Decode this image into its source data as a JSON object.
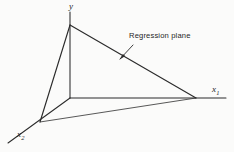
{
  "figure": {
    "background_color": "#fbfbfa",
    "stroke_color": "#2b2b2b",
    "width": 234,
    "height": 152,
    "caption": "Regression plane"
  },
  "axes": [
    {
      "id": "y",
      "label": "y",
      "subscript": "",
      "description": "vertical response axis",
      "from": [
        70,
        98
      ],
      "to": [
        70,
        12
      ]
    },
    {
      "id": "x1",
      "label": "x",
      "subscript": "1",
      "description": "horizontal axis to the right",
      "from": [
        70,
        98
      ],
      "to": [
        226,
        98
      ]
    },
    {
      "id": "x2",
      "label": "x",
      "subscript": "2",
      "description": "depth axis toward lower left",
      "from": [
        70,
        98
      ],
      "to": [
        8,
        143
      ]
    }
  ],
  "plane": {
    "name": "Regression plane",
    "vertices": [
      [
        70,
        25
      ],
      [
        196,
        98
      ],
      [
        40,
        122
      ]
    ]
  },
  "reference_box": {
    "description": "projection lines of the plane onto the axes",
    "segments": [
      [
        [
          70,
          25
        ],
        [
          70,
          98
        ]
      ],
      [
        [
          70,
          98
        ],
        [
          196,
          98
        ]
      ],
      [
        [
          70,
          98
        ],
        [
          40,
          122
        ]
      ],
      [
        [
          40,
          122
        ],
        [
          196,
          98
        ]
      ]
    ]
  },
  "annotation": {
    "text": "Regression plane",
    "text_position": [
      129,
      32
    ],
    "pointer_from": [
      133,
      45
    ],
    "pointer_to": [
      120,
      59
    ]
  }
}
